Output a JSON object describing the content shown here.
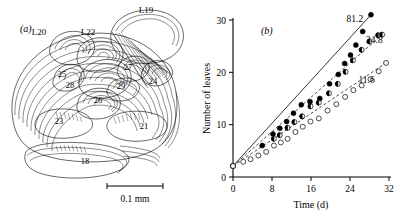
{
  "figure": {
    "panel_a": {
      "letter": "(a)",
      "scale_bar_label": "0.1 mm",
      "leaf_labels": [
        {
          "id": "L19",
          "text": "L19",
          "x": 146,
          "y": 13
        },
        {
          "id": "L20",
          "text": "L20",
          "x": 39,
          "y": 35
        },
        {
          "id": "L22",
          "text": "L22",
          "x": 88,
          "y": 35
        }
      ],
      "primordia_labels": [
        {
          "id": "p25",
          "text": "25",
          "x": 62,
          "y": 77
        },
        {
          "id": "p27",
          "text": "27",
          "x": 128,
          "y": 70
        },
        {
          "id": "p28",
          "text": "28",
          "x": 70,
          "y": 88
        },
        {
          "id": "p29",
          "text": "29",
          "x": 121,
          "y": 89
        },
        {
          "id": "p24",
          "text": "24",
          "x": 153,
          "y": 84
        },
        {
          "id": "p26",
          "text": "26",
          "x": 98,
          "y": 103
        },
        {
          "id": "p23",
          "text": "23",
          "x": 59,
          "y": 124
        },
        {
          "id": "p21",
          "text": "21",
          "x": 144,
          "y": 129
        },
        {
          "id": "p18",
          "text": "18",
          "x": 85,
          "y": 164
        }
      ]
    },
    "panel_b": {
      "letter": "(b)"
    }
  },
  "chart_data": {
    "type": "scatter",
    "title": "",
    "xlabel": "Time (d)",
    "ylabel": "Number of leaves",
    "xlim": [
      0,
      32
    ],
    "ylim": [
      0,
      30
    ],
    "xticks": [
      0,
      8,
      16,
      24,
      32
    ],
    "yticks": [
      0,
      10,
      20,
      30
    ],
    "grid": false,
    "legend_position": "inline-right-of-series",
    "series": [
      {
        "name": "81.2",
        "label": "81.2",
        "marker": "filled-circle",
        "line": "solid",
        "annotation_x": 25.0,
        "annotation_y": 29.6,
        "points": [
          {
            "x": 0.0,
            "y": 2.1
          },
          {
            "x": 6.0,
            "y": 6.0
          },
          {
            "x": 8.2,
            "y": 8.2
          },
          {
            "x": 9.6,
            "y": 9.3
          },
          {
            "x": 11.0,
            "y": 10.6
          },
          {
            "x": 12.4,
            "y": 12.2
          },
          {
            "x": 14.0,
            "y": 13.8
          },
          {
            "x": 15.8,
            "y": 14.4
          },
          {
            "x": 17.8,
            "y": 15.0
          },
          {
            "x": 19.8,
            "y": 17.8
          },
          {
            "x": 21.6,
            "y": 19.6
          },
          {
            "x": 22.9,
            "y": 21.7
          },
          {
            "x": 24.1,
            "y": 23.3
          },
          {
            "x": 25.2,
            "y": 25.2
          },
          {
            "x": 26.6,
            "y": 27.8
          },
          {
            "x": 28.3,
            "y": 31.0
          }
        ],
        "fit_line": {
          "x0": 0.0,
          "y0": 2.1,
          "x1": 28.3,
          "y1": 31.0
        }
      },
      {
        "name": "34.8",
        "label": "34.8",
        "marker": "half-filled-circle",
        "line": "dashed",
        "annotation_x": 29.0,
        "annotation_y": 25.6,
        "points": [
          {
            "x": 0.0,
            "y": 2.1
          },
          {
            "x": 8.4,
            "y": 7.3
          },
          {
            "x": 9.6,
            "y": 8.0
          },
          {
            "x": 11.2,
            "y": 9.4
          },
          {
            "x": 12.6,
            "y": 10.5
          },
          {
            "x": 14.2,
            "y": 11.6
          },
          {
            "x": 15.9,
            "y": 13.5
          },
          {
            "x": 17.6,
            "y": 14.2
          },
          {
            "x": 19.7,
            "y": 16.0
          },
          {
            "x": 21.5,
            "y": 17.8
          },
          {
            "x": 23.1,
            "y": 20.1
          },
          {
            "x": 24.6,
            "y": 22.3
          },
          {
            "x": 26.4,
            "y": 24.3
          },
          {
            "x": 28.0,
            "y": 25.9
          },
          {
            "x": 29.8,
            "y": 27.1
          },
          {
            "x": 30.6,
            "y": 27.2
          }
        ],
        "fit_line": {
          "x0": 0.0,
          "y0": 2.1,
          "x1": 30.6,
          "y1": 27.2
        }
      },
      {
        "name": "11.6",
        "label": "11.6",
        "marker": "open-circle",
        "line": "dashed",
        "annotation_x": 27.4,
        "annotation_y": 18.0,
        "points": [
          {
            "x": 0.0,
            "y": 2.1
          },
          {
            "x": 2.1,
            "y": 2.9
          },
          {
            "x": 3.6,
            "y": 3.4
          },
          {
            "x": 5.2,
            "y": 4.1
          },
          {
            "x": 6.8,
            "y": 4.8
          },
          {
            "x": 8.4,
            "y": 6.0
          },
          {
            "x": 9.8,
            "y": 6.6
          },
          {
            "x": 11.2,
            "y": 7.3
          },
          {
            "x": 12.8,
            "y": 8.6
          },
          {
            "x": 14.3,
            "y": 9.6
          },
          {
            "x": 15.9,
            "y": 10.6
          },
          {
            "x": 17.6,
            "y": 11.2
          },
          {
            "x": 19.4,
            "y": 12.7
          },
          {
            "x": 21.2,
            "y": 13.9
          },
          {
            "x": 23.0,
            "y": 15.3
          },
          {
            "x": 24.7,
            "y": 16.6
          },
          {
            "x": 26.4,
            "y": 17.5
          },
          {
            "x": 28.2,
            "y": 18.7
          },
          {
            "x": 29.9,
            "y": 20.2
          },
          {
            "x": 31.4,
            "y": 21.8
          }
        ],
        "fit_line": {
          "x0": 0.0,
          "y0": 2.1,
          "x1": 31.4,
          "y1": 21.8
        }
      }
    ]
  }
}
